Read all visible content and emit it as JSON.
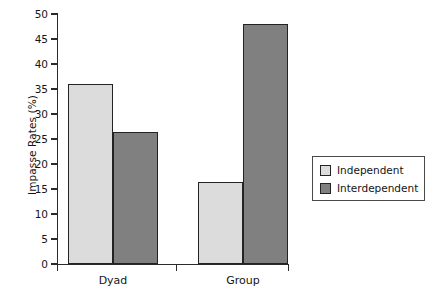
{
  "chart_data": {
    "type": "bar",
    "title": "",
    "xlabel": "",
    "ylabel": "Impasse Rates (%)",
    "categories": [
      "Dyad",
      "Group"
    ],
    "series": [
      {
        "name": "Independent",
        "color": "#dcdcdc",
        "values": [
          36.0,
          16.5
        ]
      },
      {
        "name": "Interdependent",
        "color": "#808080",
        "values": [
          26.4,
          48.0
        ]
      }
    ],
    "ylim": [
      0,
      50
    ],
    "ytick_step": 5,
    "yticks": [
      0,
      5,
      10,
      15,
      20,
      25,
      30,
      35,
      40,
      45,
      50
    ],
    "ytick_labels": [
      "0",
      "5",
      "10",
      "15",
      "20",
      "25",
      "30",
      "35",
      "40",
      "45",
      "50"
    ],
    "grid": false,
    "legend_position": "right-outside",
    "legend_entries": [
      "Independent",
      "Interdependent"
    ],
    "annotations": []
  },
  "axes": {
    "y_title": "Impasse Rates (%)",
    "x_categories": [
      {
        "label": "Dyad"
      },
      {
        "label": "Group"
      }
    ]
  },
  "legend": {
    "items": [
      {
        "label": "Independent",
        "swatch": "light-gray-swatch"
      },
      {
        "label": "Interdependent",
        "swatch": "dark-gray-swatch"
      }
    ]
  },
  "colors": {
    "light_gray": "#dcdcdc",
    "dark_gray": "#808080",
    "outline": "#232323",
    "axis": "#2b2b2b",
    "background": "#ffffff"
  }
}
